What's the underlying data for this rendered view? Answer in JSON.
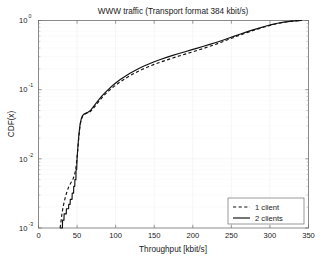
{
  "chart_data": {
    "type": "line",
    "title": "WWW traffic (Transport format 384 kbit/s)",
    "xlabel": "Throughput [kbit/s]",
    "ylabel": "CDF(x)",
    "xlim": [
      0,
      350
    ],
    "ylim": [
      0.001,
      1
    ],
    "yscale": "log",
    "xscale": "linear",
    "grid": true,
    "legend_position": "lower right",
    "xticks": [
      0,
      50,
      100,
      150,
      200,
      250,
      300,
      350
    ],
    "xtick_labels": [
      "0",
      "50",
      "100",
      "150",
      "200",
      "250",
      "300",
      "350"
    ],
    "yticks": [
      1,
      0.1,
      0.01,
      0.001
    ],
    "ytick_labels": [
      "10^0",
      "10^-1",
      "10^-2",
      "10^-3"
    ],
    "ytick_mantissa": [
      "10",
      "10",
      "10",
      "10"
    ],
    "ytick_exponent": [
      "0",
      "-1",
      "-2",
      "-3"
    ],
    "series": [
      {
        "name": "1 client",
        "style": "dashed",
        "color": "#111111",
        "points": [
          [
            28.0,
            0.001
          ],
          [
            29.0,
            0.0012
          ],
          [
            30.0,
            0.0015
          ],
          [
            31.5,
            0.0019
          ],
          [
            33.0,
            0.0023
          ],
          [
            34.5,
            0.0027
          ],
          [
            36.0,
            0.0031
          ],
          [
            37.5,
            0.0035
          ],
          [
            39.0,
            0.0039
          ],
          [
            40.5,
            0.0042
          ],
          [
            42.0,
            0.0045
          ],
          [
            43.5,
            0.0048
          ],
          [
            45.0,
            0.0052
          ],
          [
            46.5,
            0.0058
          ],
          [
            48.0,
            0.0068
          ],
          [
            49.0,
            0.0082
          ],
          [
            50.0,
            0.0105
          ],
          [
            51.0,
            0.014
          ],
          [
            52.0,
            0.019
          ],
          [
            53.0,
            0.025
          ],
          [
            54.0,
            0.031
          ],
          [
            55.5,
            0.037
          ],
          [
            57.0,
            0.041
          ],
          [
            59.0,
            0.0435
          ],
          [
            61.0,
            0.045
          ],
          [
            64.0,
            0.0462
          ],
          [
            67.0,
            0.048
          ],
          [
            70.0,
            0.052
          ],
          [
            74.0,
            0.059
          ],
          [
            78.0,
            0.067
          ],
          [
            82.0,
            0.076
          ],
          [
            86.0,
            0.085
          ],
          [
            90.0,
            0.094
          ],
          [
            95.0,
            0.105
          ],
          [
            100.0,
            0.116
          ],
          [
            106.0,
            0.13
          ],
          [
            112.0,
            0.144
          ],
          [
            118.0,
            0.158
          ],
          [
            124.0,
            0.172
          ],
          [
            130.0,
            0.186
          ],
          [
            136.0,
            0.2
          ],
          [
            143.0,
            0.216
          ],
          [
            150.0,
            0.232
          ],
          [
            158.0,
            0.25
          ],
          [
            166.0,
            0.268
          ],
          [
            174.0,
            0.287
          ],
          [
            182.0,
            0.306
          ],
          [
            190.0,
            0.326
          ],
          [
            198.0,
            0.347
          ],
          [
            206.0,
            0.37
          ],
          [
            214.0,
            0.395
          ],
          [
            222.0,
            0.423
          ],
          [
            230.0,
            0.454
          ],
          [
            238.0,
            0.49
          ],
          [
            246.0,
            0.53
          ],
          [
            254.0,
            0.574
          ],
          [
            262.0,
            0.62
          ],
          [
            270.0,
            0.668
          ],
          [
            278.0,
            0.716
          ],
          [
            286.0,
            0.764
          ],
          [
            294.0,
            0.812
          ],
          [
            302.0,
            0.86
          ],
          [
            310.0,
            0.905
          ],
          [
            318.0,
            0.942
          ],
          [
            326.0,
            0.97
          ],
          [
            332.0,
            0.987
          ],
          [
            337.0,
            0.996
          ],
          [
            341.0,
            1.0
          ]
        ]
      },
      {
        "name": "2 clients",
        "style": "solid",
        "color": "#111111",
        "points": [
          [
            28.5,
            0.001
          ],
          [
            31.0,
            0.001
          ],
          [
            31.2,
            0.0013
          ],
          [
            33.0,
            0.0013
          ],
          [
            33.2,
            0.0016
          ],
          [
            36.0,
            0.0016
          ],
          [
            36.2,
            0.0019
          ],
          [
            39.0,
            0.0019
          ],
          [
            39.2,
            0.0022
          ],
          [
            41.0,
            0.0022
          ],
          [
            41.2,
            0.0026
          ],
          [
            43.5,
            0.0026
          ],
          [
            43.7,
            0.0032
          ],
          [
            45.5,
            0.0032
          ],
          [
            45.7,
            0.004
          ],
          [
            47.0,
            0.004
          ],
          [
            47.2,
            0.005
          ],
          [
            48.5,
            0.005
          ],
          [
            48.7,
            0.007
          ],
          [
            49.5,
            0.007
          ],
          [
            50.0,
            0.01
          ],
          [
            51.0,
            0.0145
          ],
          [
            52.0,
            0.02
          ],
          [
            53.0,
            0.026
          ],
          [
            54.0,
            0.032
          ],
          [
            55.5,
            0.038
          ],
          [
            57.0,
            0.042
          ],
          [
            59.0,
            0.0443
          ],
          [
            61.0,
            0.0455
          ],
          [
            64.0,
            0.047
          ],
          [
            67.0,
            0.0495
          ],
          [
            70.0,
            0.0545
          ],
          [
            74.0,
            0.0625
          ],
          [
            78.0,
            0.071
          ],
          [
            82.0,
            0.0805
          ],
          [
            86.0,
            0.09
          ],
          [
            90.0,
            0.0995
          ],
          [
            95.0,
            0.112
          ],
          [
            100.0,
            0.125
          ],
          [
            106.0,
            0.14
          ],
          [
            112.0,
            0.1555
          ],
          [
            118.0,
            0.171
          ],
          [
            124.0,
            0.1865
          ],
          [
            130.0,
            0.202
          ],
          [
            136.0,
            0.2175
          ],
          [
            143.0,
            0.235
          ],
          [
            150.0,
            0.253
          ],
          [
            158.0,
            0.273
          ],
          [
            166.0,
            0.293
          ],
          [
            174.0,
            0.313
          ],
          [
            182.0,
            0.333
          ],
          [
            190.0,
            0.354
          ],
          [
            198.0,
            0.376
          ],
          [
            206.0,
            0.399
          ],
          [
            214.0,
            0.424
          ],
          [
            222.0,
            0.451
          ],
          [
            230.0,
            0.481
          ],
          [
            238.0,
            0.515
          ],
          [
            246.0,
            0.553
          ],
          [
            254.0,
            0.595
          ],
          [
            262.0,
            0.639
          ],
          [
            270.0,
            0.685
          ],
          [
            278.0,
            0.731
          ],
          [
            286.0,
            0.777
          ],
          [
            294.0,
            0.824
          ],
          [
            302.0,
            0.87
          ],
          [
            310.0,
            0.912
          ],
          [
            318.0,
            0.947
          ],
          [
            326.0,
            0.973
          ],
          [
            332.0,
            0.989
          ],
          [
            337.0,
            0.997
          ],
          [
            341.0,
            1.0
          ]
        ]
      }
    ]
  },
  "legend": {
    "entries": [
      {
        "label": "1 client",
        "style": "dashed"
      },
      {
        "label": "2 clients",
        "style": "solid"
      }
    ]
  }
}
